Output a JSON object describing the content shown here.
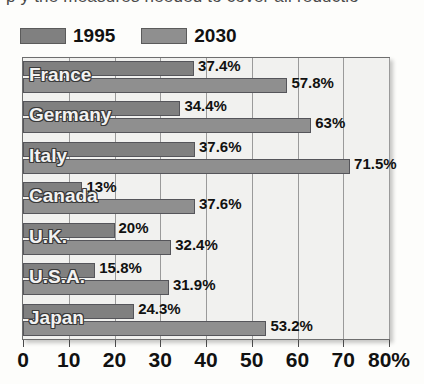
{
  "clipped_text": "p y  the measures needed to cover all reductio",
  "legend": {
    "entries": [
      {
        "label": "1995",
        "color": "#808080",
        "swatch_name": "legend-swatch-1995"
      },
      {
        "label": "2030",
        "color": "#8f8f8f",
        "swatch_name": "legend-swatch-2030"
      }
    ]
  },
  "axis": {
    "ticks": [
      "0",
      "10",
      "20",
      "30",
      "40",
      "50",
      "60",
      "70",
      "80%"
    ]
  },
  "chart_data": {
    "type": "bar",
    "orientation": "horizontal",
    "title": "",
    "xlabel": "",
    "ylabel": "",
    "xlim": [
      0,
      80
    ],
    "xticks": [
      0,
      10,
      20,
      30,
      40,
      50,
      60,
      70,
      80
    ],
    "xtick_labels": [
      "0",
      "10",
      "20",
      "30",
      "40",
      "50",
      "60",
      "70",
      "80%"
    ],
    "grid": true,
    "legend_position": "top-left",
    "categories": [
      "France",
      "Germany",
      "Italy",
      "Canada",
      "U.K.",
      "U.S.A.",
      "Japan"
    ],
    "series": [
      {
        "name": "1995",
        "color": "#808080",
        "values": [
          37.4,
          34.4,
          37.6,
          13,
          20,
          15.8,
          24.3
        ],
        "labels": [
          "37.4%",
          "34.4%",
          "37.6%",
          "13%",
          "20%",
          "15.8%",
          "24.3%"
        ]
      },
      {
        "name": "2030",
        "color": "#8f8f8f",
        "values": [
          57.8,
          63,
          71.5,
          37.6,
          32.4,
          31.9,
          53.2
        ],
        "labels": [
          "57.8%",
          "63%",
          "71.5%",
          "37.6%",
          "32.4%",
          "31.9%",
          "53.2%"
        ]
      }
    ]
  }
}
